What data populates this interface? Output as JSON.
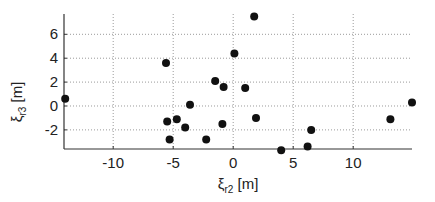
{
  "chart_data": {
    "type": "scatter",
    "title": "",
    "xlabel": "ξ_r2 [m]",
    "ylabel": "ξ_r3 [m]",
    "xlabel_parts": {
      "symbol": "ξ",
      "sub": "r2",
      "unit": " [m]"
    },
    "ylabel_parts": {
      "symbol": "ξ",
      "sub": "r3",
      "unit": " [m]"
    },
    "xlim": [
      -14.1,
      14.9
    ],
    "ylim": [
      -3.6,
      7.7
    ],
    "xticks": [
      -10,
      -5,
      0,
      5,
      10
    ],
    "yticks": [
      -2,
      0,
      2,
      4,
      6
    ],
    "xtick_labels": [
      "-10",
      "-5",
      "0",
      "5",
      "10"
    ],
    "ytick_labels": [
      "-2",
      "0",
      "2",
      "4",
      "6"
    ],
    "grid": true,
    "grid_style": "dotted",
    "legend": null,
    "marker_color": "#111111",
    "points": [
      {
        "x": -14.0,
        "y": 0.6
      },
      {
        "x": -5.6,
        "y": 3.6
      },
      {
        "x": -3.6,
        "y": 0.1
      },
      {
        "x": -5.5,
        "y": -1.3
      },
      {
        "x": -4.7,
        "y": -1.1
      },
      {
        "x": -4.0,
        "y": -1.8
      },
      {
        "x": -5.3,
        "y": -2.8
      },
      {
        "x": -2.25,
        "y": -2.8
      },
      {
        "x": -1.5,
        "y": 2.1
      },
      {
        "x": -0.8,
        "y": 1.6
      },
      {
        "x": -0.9,
        "y": -1.5
      },
      {
        "x": 0.1,
        "y": 4.4
      },
      {
        "x": 1.0,
        "y": 1.5
      },
      {
        "x": 1.75,
        "y": 7.5
      },
      {
        "x": 1.9,
        "y": -1.0
      },
      {
        "x": 4.0,
        "y": -3.7
      },
      {
        "x": 6.2,
        "y": -3.4
      },
      {
        "x": 6.5,
        "y": -2.0
      },
      {
        "x": 13.1,
        "y": -1.1
      },
      {
        "x": 14.9,
        "y": 0.3
      }
    ]
  }
}
